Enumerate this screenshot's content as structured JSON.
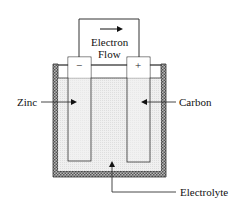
{
  "diagram": {
    "title_top_line1": "Electron",
    "title_top_line2": "Flow",
    "negative_terminal": "−",
    "positive_terminal": "+",
    "labels": {
      "left_electrode": "Zinc",
      "right_electrode": "Carbon",
      "bottom": "Electrolyte"
    },
    "colors": {
      "line": "#333333",
      "electrolyte_fill": "#ececec",
      "hatch_dark": "#555555",
      "hatch_light": "#bbbbbb",
      "background": "#ffffff"
    }
  }
}
